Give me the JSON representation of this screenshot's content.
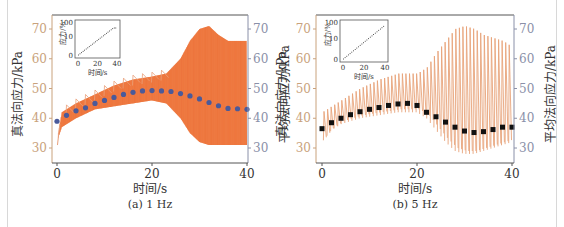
{
  "figure": {
    "panels": [
      {
        "id": "a",
        "caption": "(a)  1 Hz",
        "xlabel": "时间/s",
        "ylabel_left": "真法向应力/kPa",
        "ylabel_right": "平均法向应力/kPa",
        "inset": {
          "ylabel": "应力/%",
          "xlabel": "时间/s",
          "yticks": [
            "0",
            "10",
            "100"
          ],
          "xticks": [
            "0",
            "20",
            "40"
          ]
        }
      },
      {
        "id": "b",
        "caption": "(b)  5 Hz",
        "xlabel": "时间/s",
        "ylabel_left": "真法向应力/kPa",
        "ylabel_right": "平均法向应力/kPa",
        "inset": {
          "ylabel": "应力/%",
          "xlabel": "时间/s",
          "yticks": [
            "0",
            "10",
            "100"
          ],
          "xticks": [
            "0",
            "20",
            "40"
          ]
        }
      }
    ],
    "colors": {
      "oscillation_a": "#f26a2e",
      "oscillation_b": "#e8a47a",
      "mean_a": "#4a5a9a",
      "mean_b": "#111111",
      "left_axis": "#c9a27c",
      "right_axis": "#8a90a8"
    }
  },
  "chart_data": [
    {
      "type": "line",
      "title": "(a) 1 Hz",
      "xlabel": "时间/s",
      "ylabel": "真法向应力/kPa",
      "ylabel_right": "平均法向应力/kPa",
      "xlim": [
        0,
        40
      ],
      "ylim": [
        25,
        75
      ],
      "xticks": [
        0,
        20,
        40
      ],
      "yticks": [
        30,
        40,
        50,
        60,
        70
      ],
      "series": [
        {
          "name": "真法向应力 envelope upper",
          "x": [
            0,
            1,
            4,
            8,
            12,
            16,
            20,
            23,
            26,
            28,
            30,
            32,
            34,
            36,
            38,
            40
          ],
          "values": [
            32,
            42,
            45,
            48,
            51,
            53,
            54,
            55,
            60,
            66,
            70,
            71,
            68,
            66,
            66,
            66
          ]
        },
        {
          "name": "真法向应力 envelope lower",
          "x": [
            0,
            1,
            4,
            8,
            12,
            16,
            20,
            23,
            26,
            28,
            30,
            32,
            34,
            36,
            38,
            40
          ],
          "values": [
            32,
            37,
            40,
            43,
            44,
            45,
            46,
            45,
            40,
            35,
            32,
            31,
            31,
            31,
            31,
            31
          ]
        },
        {
          "name": "平均法向应力",
          "x": [
            0,
            2,
            4,
            6,
            8,
            10,
            12,
            14,
            16,
            18,
            20,
            22,
            24,
            26,
            28,
            30,
            32,
            34,
            36,
            38,
            40
          ],
          "values": [
            39,
            41,
            42.5,
            43.5,
            45,
            46,
            47,
            48,
            48.7,
            49.2,
            49.3,
            49.2,
            49,
            48.3,
            47.5,
            46.5,
            45.3,
            44.2,
            43.3,
            43.2,
            43
          ]
        }
      ],
      "inset": {
        "type": "line",
        "xlabel": "时间/s",
        "ylabel": "应力/%",
        "x": [
          0,
          36,
          40
        ],
        "values": [
          0,
          90,
          90
        ],
        "yticks": [
          "0",
          "10",
          "100"
        ],
        "xticks": [
          0,
          20,
          40
        ]
      }
    },
    {
      "type": "line",
      "title": "(b) 5 Hz",
      "xlabel": "时间/s",
      "ylabel": "真法向应力/kPa",
      "ylabel_right": "平均法向应力/kPa",
      "xlim": [
        0,
        40
      ],
      "ylim": [
        25,
        75
      ],
      "xticks": [
        0,
        20,
        40
      ],
      "yticks": [
        30,
        40,
        50,
        60,
        70
      ],
      "series": [
        {
          "name": "真法向应力 envelope upper",
          "x": [
            0,
            2,
            4,
            8,
            12,
            16,
            20,
            22,
            24,
            26,
            28,
            30,
            32,
            34,
            36,
            38,
            40
          ],
          "values": [
            42,
            44,
            46,
            50,
            53,
            55,
            55,
            57,
            62,
            66,
            70,
            71,
            70,
            68,
            67,
            66,
            64
          ]
        },
        {
          "name": "真法向应力 envelope lower",
          "x": [
            0,
            2,
            4,
            8,
            12,
            16,
            20,
            22,
            24,
            26,
            28,
            30,
            32,
            34,
            36,
            38,
            40
          ],
          "values": [
            32,
            36,
            38,
            40,
            41,
            42,
            42,
            40,
            36,
            32,
            29,
            28,
            28,
            29,
            30,
            31,
            32
          ]
        },
        {
          "name": "平均法向应力",
          "x": [
            0,
            2,
            4,
            6,
            8,
            10,
            12,
            14,
            16,
            18,
            20,
            22,
            24,
            26,
            28,
            30,
            32,
            34,
            36,
            38,
            40
          ],
          "values": [
            36.5,
            38.5,
            40,
            41.2,
            42.2,
            43,
            43.6,
            44.3,
            44.8,
            45,
            44.3,
            42,
            40.5,
            38.7,
            37,
            35.7,
            35.2,
            35.5,
            36.2,
            37,
            37
          ]
        }
      ],
      "inset": {
        "type": "line",
        "xlabel": "时间/s",
        "ylabel": "应力/%",
        "x": [
          0,
          40
        ],
        "values": [
          0,
          100
        ],
        "yticks": [
          "0",
          "10",
          "100"
        ],
        "xticks": [
          0,
          20,
          40
        ]
      }
    }
  ]
}
